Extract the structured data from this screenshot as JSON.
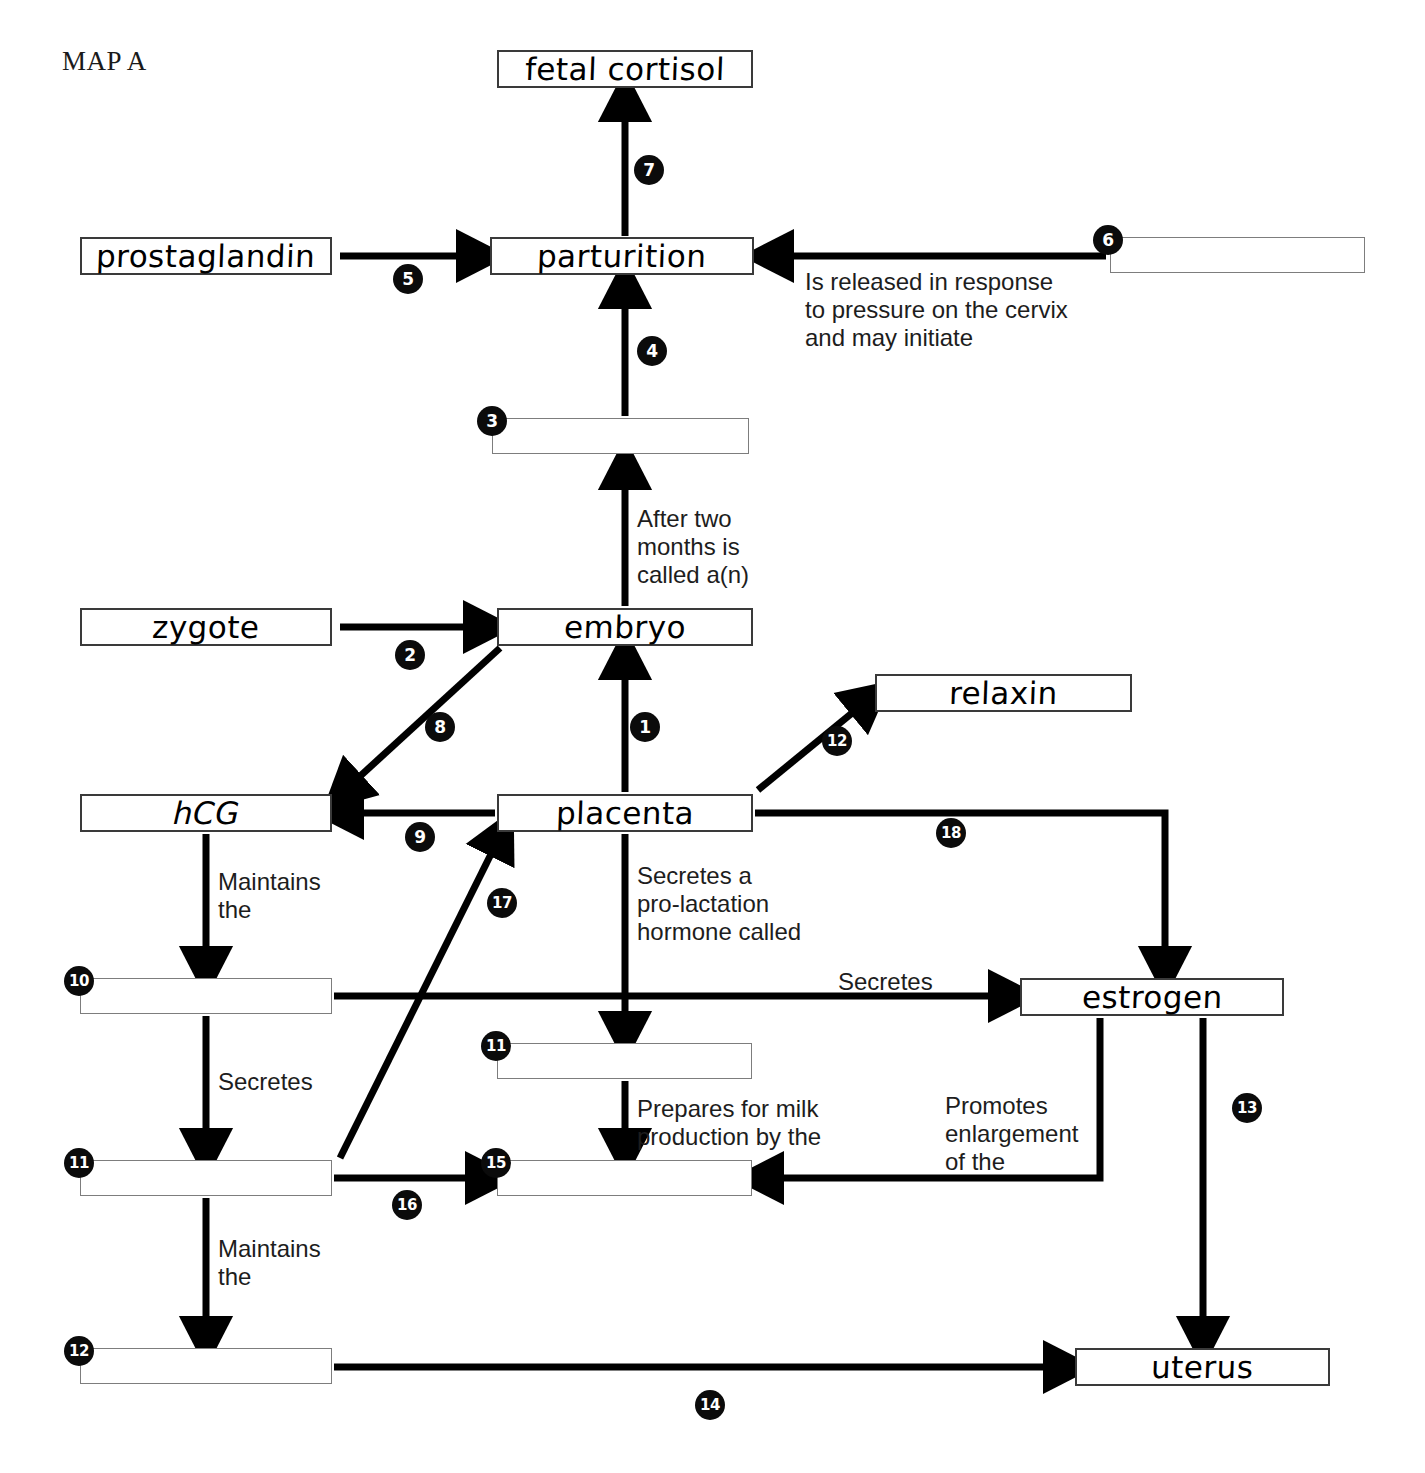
{
  "title": "MAP A",
  "nodes": [
    {
      "id": "fetal_cortisol",
      "label": "fetal cortisol",
      "x": 497,
      "y": 50,
      "w": 256,
      "h": 38,
      "filled": true,
      "italic": false
    },
    {
      "id": "prostaglandin",
      "label": "prostaglandin",
      "x": 80,
      "y": 237,
      "w": 252,
      "h": 38,
      "filled": true,
      "italic": false
    },
    {
      "id": "parturition",
      "label": "parturition",
      "x": 490,
      "y": 237,
      "w": 264,
      "h": 38,
      "filled": true,
      "italic": false
    },
    {
      "id": "blank6",
      "label": "",
      "x": 1110,
      "y": 237,
      "w": 255,
      "h": 36,
      "filled": false,
      "italic": false
    },
    {
      "id": "blank3",
      "label": "",
      "x": 492,
      "y": 418,
      "w": 257,
      "h": 36,
      "filled": false,
      "italic": false
    },
    {
      "id": "zygote",
      "label": "zygote",
      "x": 80,
      "y": 608,
      "w": 252,
      "h": 38,
      "filled": true,
      "italic": false
    },
    {
      "id": "embryo",
      "label": "embryo",
      "x": 497,
      "y": 608,
      "w": 256,
      "h": 38,
      "filled": true,
      "italic": false
    },
    {
      "id": "relaxin",
      "label": "relaxin",
      "x": 875,
      "y": 674,
      "w": 257,
      "h": 38,
      "filled": true,
      "italic": false
    },
    {
      "id": "hCG",
      "label": "hCG",
      "x": 80,
      "y": 794,
      "w": 252,
      "h": 38,
      "filled": true,
      "italic": true
    },
    {
      "id": "placenta",
      "label": "placenta",
      "x": 497,
      "y": 794,
      "w": 256,
      "h": 38,
      "filled": true,
      "italic": false
    },
    {
      "id": "blank10",
      "label": "",
      "x": 80,
      "y": 978,
      "w": 252,
      "h": 36,
      "filled": false,
      "italic": false
    },
    {
      "id": "estrogen",
      "label": "estrogen",
      "x": 1020,
      "y": 978,
      "w": 264,
      "h": 38,
      "filled": true,
      "italic": false
    },
    {
      "id": "blank11_mid",
      "label": "",
      "x": 497,
      "y": 1043,
      "w": 255,
      "h": 36,
      "filled": false,
      "italic": false
    },
    {
      "id": "blank11_left",
      "label": "",
      "x": 80,
      "y": 1160,
      "w": 252,
      "h": 36,
      "filled": false,
      "italic": false
    },
    {
      "id": "blank15",
      "label": "",
      "x": 497,
      "y": 1160,
      "w": 255,
      "h": 36,
      "filled": false,
      "italic": false
    },
    {
      "id": "blank12",
      "label": "",
      "x": 80,
      "y": 1348,
      "w": 252,
      "h": 36,
      "filled": false,
      "italic": false
    },
    {
      "id": "uterus",
      "label": "uterus",
      "x": 1075,
      "y": 1348,
      "w": 255,
      "h": 38,
      "filled": true,
      "italic": false
    }
  ],
  "numbers": [
    {
      "id": "n1",
      "value": "1",
      "x": 630,
      "y": 712
    },
    {
      "id": "n2",
      "value": "2",
      "x": 395,
      "y": 640
    },
    {
      "id": "n3",
      "value": "3",
      "x": 477,
      "y": 406
    },
    {
      "id": "n4",
      "value": "4",
      "x": 637,
      "y": 336
    },
    {
      "id": "n5",
      "value": "5",
      "x": 393,
      "y": 264
    },
    {
      "id": "n6",
      "value": "6",
      "x": 1093,
      "y": 225
    },
    {
      "id": "n7",
      "value": "7",
      "x": 634,
      "y": 155
    },
    {
      "id": "n8",
      "value": "8",
      "x": 425,
      "y": 712
    },
    {
      "id": "n9",
      "value": "9",
      "x": 405,
      "y": 822
    },
    {
      "id": "n10",
      "value": "10",
      "x": 64,
      "y": 966
    },
    {
      "id": "n11mid",
      "value": "11",
      "x": 481,
      "y": 1031
    },
    {
      "id": "n11left",
      "value": "11",
      "x": 64,
      "y": 1148
    },
    {
      "id": "n12",
      "value": "12",
      "x": 64,
      "y": 1336
    },
    {
      "id": "n12r",
      "value": "12",
      "x": 822,
      "y": 726
    },
    {
      "id": "n13",
      "value": "13",
      "x": 1232,
      "y": 1093
    },
    {
      "id": "n14",
      "value": "14",
      "x": 695,
      "y": 1390
    },
    {
      "id": "n15",
      "value": "15",
      "x": 481,
      "y": 1148
    },
    {
      "id": "n16",
      "value": "16",
      "x": 392,
      "y": 1190
    },
    {
      "id": "n17",
      "value": "17",
      "x": 487,
      "y": 888
    },
    {
      "id": "n18",
      "value": "18",
      "x": 936,
      "y": 818
    }
  ],
  "captions": [
    {
      "id": "cap_cervix",
      "text": "Is released in response\nto pressure on the cervix\nand may initiate",
      "x": 805,
      "y": 268
    },
    {
      "id": "cap_twomonths",
      "text": "After two\nmonths is\ncalled a(n)",
      "x": 637,
      "y": 505
    },
    {
      "id": "cap_maintains1",
      "text": "Maintains\nthe",
      "x": 218,
      "y": 868
    },
    {
      "id": "cap_prolact",
      "text": "Secretes a\npro-lactation\nhormone called",
      "x": 637,
      "y": 862
    },
    {
      "id": "cap_secretes1",
      "text": "Secretes",
      "x": 218,
      "y": 1068
    },
    {
      "id": "cap_secretes2",
      "text": "Secretes",
      "x": 838,
      "y": 968
    },
    {
      "id": "cap_milk",
      "text": "Prepares for milk\nproduction by the",
      "x": 637,
      "y": 1095
    },
    {
      "id": "cap_promotes",
      "text": "Promotes\nenlargement\nof the",
      "x": 945,
      "y": 1092
    },
    {
      "id": "cap_maintains2",
      "text": "Maintains\nthe",
      "x": 218,
      "y": 1235
    }
  ],
  "colors": {
    "ink": "#000000",
    "box_border": "#3a3a3a",
    "blank_border": "#7d7d7d",
    "number_bg": "#0b0b0b",
    "number_fg": "#ffffff",
    "background": "#ffffff"
  }
}
